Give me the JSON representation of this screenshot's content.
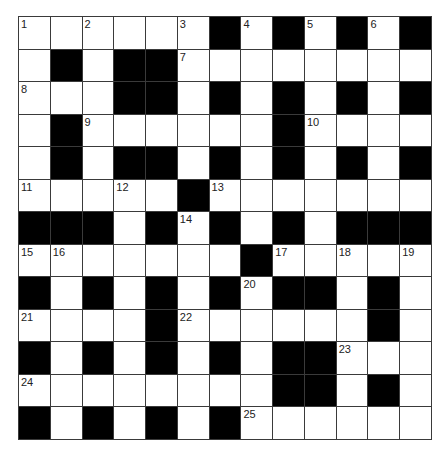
{
  "puzzle": {
    "rows": 13,
    "cols": 13,
    "colors": {
      "black": "#000000",
      "white": "#ffffff",
      "line": "#3a3a3a",
      "number": "#222222"
    },
    "layout": [
      "......#.#.#.#",
      ".#.##........",
      "...##.#.#.#.#",
      ".#......#....",
      ".#.##.#.#.#.#",
      ".....#.......",
      "###.#.#.#.###",
      ".......#.....",
      "#.#.#.#.##.#.",
      "....#......#.",
      "#.#.#.#.##...",
      "........##.#.",
      "#.#.#.#......"
    ],
    "numbers": [
      {
        "n": "1",
        "r": 0,
        "c": 0
      },
      {
        "n": "2",
        "r": 0,
        "c": 2
      },
      {
        "n": "3",
        "r": 0,
        "c": 5
      },
      {
        "n": "4",
        "r": 0,
        "c": 7
      },
      {
        "n": "5",
        "r": 0,
        "c": 9
      },
      {
        "n": "6",
        "r": 0,
        "c": 11
      },
      {
        "n": "7",
        "r": 1,
        "c": 5
      },
      {
        "n": "8",
        "r": 2,
        "c": 0
      },
      {
        "n": "9",
        "r": 3,
        "c": 2
      },
      {
        "n": "10",
        "r": 3,
        "c": 9
      },
      {
        "n": "11",
        "r": 5,
        "c": 0
      },
      {
        "n": "12",
        "r": 5,
        "c": 3
      },
      {
        "n": "13",
        "r": 5,
        "c": 6
      },
      {
        "n": "14",
        "r": 6,
        "c": 5
      },
      {
        "n": "15",
        "r": 7,
        "c": 0
      },
      {
        "n": "16",
        "r": 7,
        "c": 1
      },
      {
        "n": "17",
        "r": 7,
        "c": 8
      },
      {
        "n": "18",
        "r": 7,
        "c": 10
      },
      {
        "n": "19",
        "r": 7,
        "c": 12
      },
      {
        "n": "20",
        "r": 8,
        "c": 7
      },
      {
        "n": "21",
        "r": 9,
        "c": 0
      },
      {
        "n": "22",
        "r": 9,
        "c": 5
      },
      {
        "n": "23",
        "r": 10,
        "c": 10
      },
      {
        "n": "24",
        "r": 11,
        "c": 0
      },
      {
        "n": "25",
        "r": 12,
        "c": 7
      }
    ]
  }
}
